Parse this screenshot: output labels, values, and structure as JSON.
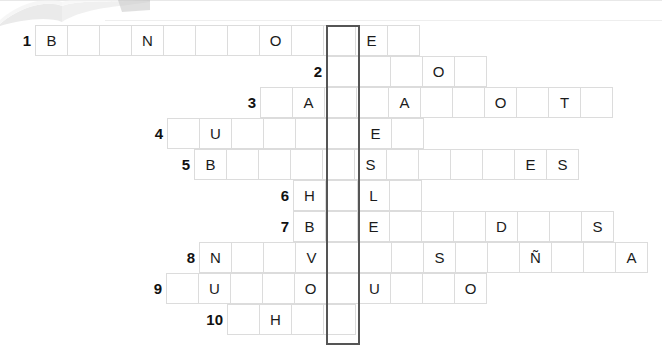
{
  "puzzle": {
    "title": "crossword-grid",
    "cell_width": 33,
    "cell_height": 31,
    "key_column": {
      "name": "highlighted-key-column",
      "x": 326,
      "y": 25,
      "width": 34,
      "height": 320,
      "border_color": "#555555"
    },
    "grid_colors": {
      "cell_border": "#dcdcdc",
      "cell_background": "#ffffff",
      "letter_color": "#1b1b1b",
      "clue_number_color": "#111111"
    },
    "rows": [
      {
        "number": "1",
        "x": 35,
        "y": 25,
        "cells": [
          "B",
          "",
          "",
          "N",
          "",
          "",
          "",
          "O",
          "",
          "",
          "E",
          ""
        ]
      },
      {
        "number": "2",
        "x": 326,
        "y": 56,
        "cells": [
          "",
          "",
          "",
          "O",
          ""
        ]
      },
      {
        "number": "3",
        "x": 260,
        "y": 87,
        "cells": [
          "",
          "A",
          "",
          "",
          "A",
          "",
          "",
          "O",
          "",
          "T",
          ""
        ]
      },
      {
        "number": "4",
        "x": 167,
        "y": 118,
        "cells": [
          "",
          "U",
          "",
          "",
          "",
          "",
          "E",
          ""
        ]
      },
      {
        "number": "5",
        "x": 194,
        "y": 149,
        "cells": [
          "B",
          "",
          "",
          "",
          "",
          "S",
          "",
          "",
          "",
          "",
          "E",
          "S"
        ]
      },
      {
        "number": "6",
        "x": 293,
        "y": 180,
        "cells": [
          "H",
          "",
          "L",
          ""
        ]
      },
      {
        "number": "7",
        "x": 293,
        "y": 211,
        "cells": [
          "B",
          "",
          "E",
          "",
          "",
          "",
          "D",
          "",
          "",
          "S"
        ]
      },
      {
        "number": "8",
        "x": 199,
        "y": 242,
        "cells": [
          "N",
          "",
          "",
          "V",
          "",
          "",
          "",
          "S",
          "",
          "",
          "Ñ",
          "",
          "",
          "A"
        ]
      },
      {
        "number": "9",
        "x": 166,
        "y": 273,
        "cells": [
          "",
          "U",
          "",
          "",
          "O",
          "",
          "U",
          "",
          "",
          "O"
        ]
      },
      {
        "number": "10",
        "x": 227,
        "y": 304,
        "cells": [
          "",
          "H",
          "",
          ""
        ]
      }
    ]
  }
}
